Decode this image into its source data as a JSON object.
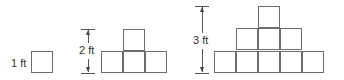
{
  "figures": [
    {
      "label": "1 ft",
      "height_ft": 1,
      "rows": [
        1
      ]
    },
    {
      "label": "2 ft",
      "height_ft": 2,
      "rows": [
        1,
        3
      ]
    },
    {
      "label": "3 ft",
      "height_ft": 3,
      "rows": [
        1,
        3,
        5
      ]
    }
  ],
  "colors": {
    "square_border": "#6e6e6e",
    "dimension_line": "#555555",
    "text": "#333333"
  }
}
